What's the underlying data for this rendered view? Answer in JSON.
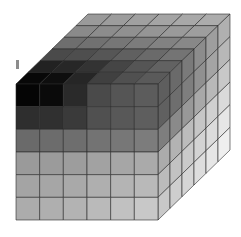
{
  "figure": {
    "type": "voxel-cube",
    "grid": {
      "nx": 6,
      "ny": 6,
      "nz": 6
    },
    "background": "#ffffff",
    "grid_line_color": "#2a2a2a",
    "geometry": {
      "front_left": 16,
      "front_top": 84,
      "front_right": 158,
      "front_bottom": 220,
      "depth_dx": 72,
      "depth_dy": -70
    },
    "front_face_rows": [
      [
        "#050505",
        "#0a0a0a",
        "#2a2a2a",
        "#4a4a4a",
        "#555555",
        "#5c5c5c"
      ],
      [
        "#2e2e2e",
        "#303030",
        "#3a3a3a",
        "#505050",
        "#585858",
        "#5e5e5e"
      ],
      [
        "#6a6a6a",
        "#6c6c6c",
        "#6e6e6e",
        "#737373",
        "#777777",
        "#7c7c7c"
      ],
      [
        "#9a9a9a",
        "#9b9b9b",
        "#9d9d9d",
        "#a2a2a2",
        "#a6a6a6",
        "#aaaaaa"
      ],
      [
        "#a4a4a4",
        "#a6a6a6",
        "#a9a9a9",
        "#afafaf",
        "#b4b4b4",
        "#b9b9b9"
      ],
      [
        "#acacac",
        "#afafaf",
        "#b3b3b3",
        "#bababa",
        "#c1c1c1",
        "#c8c8c8"
      ]
    ],
    "top_face_rows_back_to_front": [
      [
        "#9a9a9a",
        "#9c9c9c",
        "#a0a0a0",
        "#a4a4a4",
        "#a8a8a8",
        "#acacac"
      ],
      [
        "#8a8a8a",
        "#8c8c8c",
        "#909090",
        "#959595",
        "#9a9a9a",
        "#9e9e9e"
      ],
      [
        "#6e6e6e",
        "#717171",
        "#767676",
        "#7c7c7c",
        "#828282",
        "#888888"
      ],
      [
        "#4a4a4a",
        "#4e4e4e",
        "#565656",
        "#606060",
        "#6a6a6a",
        "#747474"
      ],
      [
        "#222222",
        "#272727",
        "#333333",
        "#454545",
        "#555555",
        "#626262"
      ],
      [
        "#080808",
        "#0e0e0e",
        "#262626",
        "#404040",
        "#505050",
        "#5a5a5a"
      ]
    ],
    "right_face_rows": [
      [
        "#5e5e5e",
        "#6a6a6a",
        "#7a7a7a",
        "#8c8c8c",
        "#9e9e9e",
        "#b0b0b0"
      ],
      [
        "#606060",
        "#6e6e6e",
        "#7e7e7e",
        "#909090",
        "#a4a4a4",
        "#b8b8b8"
      ],
      [
        "#7e7e7e",
        "#8a8a8a",
        "#989898",
        "#a8a8a8",
        "#b8b8b8",
        "#c8c8c8"
      ],
      [
        "#ababab",
        "#b3b3b3",
        "#bcbcbc",
        "#c6c6c6",
        "#d0d0d0",
        "#dadada"
      ],
      [
        "#bbbbbb",
        "#c2c2c2",
        "#cacaca",
        "#d3d3d3",
        "#dcdcdc",
        "#e6e6e6"
      ],
      [
        "#c8c8c8",
        "#cecece",
        "#d5d5d5",
        "#dddddd",
        "#e6e6e6",
        "#efefef"
      ]
    ],
    "marker": {
      "color": "#8c8c8c"
    }
  }
}
